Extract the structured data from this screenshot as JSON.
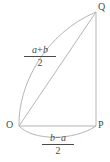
{
  "figure": {
    "type": "geometry-diagram",
    "background_color": "#ffffff",
    "stroke_color": "#b0b0b0",
    "text_color": "#4a4a4a",
    "vertices": [
      {
        "name": "O",
        "label": "O",
        "x": 19,
        "y": 126
      },
      {
        "name": "P",
        "label": "P",
        "x": 96,
        "y": 126
      },
      {
        "name": "Q",
        "label": "Q",
        "x": 96,
        "y": 12
      }
    ],
    "segments": [
      {
        "name": "side-PQ",
        "from": "P",
        "to": "Q"
      },
      {
        "name": "side-OP",
        "from": "O",
        "to": "P"
      },
      {
        "name": "chord-OQ",
        "from": "O",
        "to": "Q"
      }
    ],
    "arcs": [
      {
        "name": "arc-OQ",
        "from": "O",
        "to": "Q",
        "bulge": "left"
      },
      {
        "name": "arc-OP",
        "from": "O",
        "to": "P",
        "bulge": "down"
      }
    ],
    "labels": {
      "hypotenuse": {
        "name": "label-hypotenuse",
        "numerator_left": "a",
        "numerator_operator": "+",
        "numerator_right": "b",
        "denominator": "2",
        "text": "(a+b)/2"
      },
      "base": {
        "name": "label-base",
        "numerator_left": "b",
        "numerator_operator": "−",
        "numerator_right": "a",
        "denominator": "2",
        "text": "(b−a)/2"
      }
    }
  }
}
